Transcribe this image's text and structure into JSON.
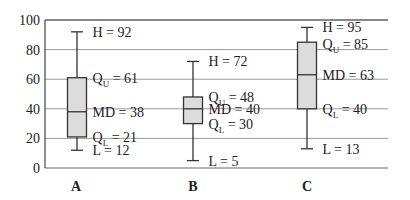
{
  "chart_data": {
    "type": "boxplot",
    "title": "",
    "xlabel": "",
    "ylabel": "",
    "ylim": [
      0,
      100
    ],
    "yticks": [
      0,
      20,
      40,
      60,
      80,
      100
    ],
    "grid": true,
    "categories": [
      "A",
      "B",
      "C"
    ],
    "series": [
      {
        "name": "A",
        "H": 92,
        "QU": 61,
        "MD": 38,
        "QL": 21,
        "L": 12,
        "labels": {
          "H": "H = 92",
          "QU": "= 61",
          "MD": "MD = 38",
          "QL": "= 21",
          "L": "L = 12"
        }
      },
      {
        "name": "B",
        "H": 72,
        "QU": 48,
        "MD": 40,
        "QL": 30,
        "L": 5,
        "labels": {
          "H": "H = 72",
          "QU": "= 48",
          "MD": "MD = 40",
          "QL": "= 30",
          "L": "L = 5"
        }
      },
      {
        "name": "C",
        "H": 95,
        "QU": 85,
        "MD": 63,
        "QL": 40,
        "L": 13,
        "labels": {
          "H": "H = 95",
          "QU": "= 85",
          "MD": "MD = 63",
          "QL": "= 40",
          "L": "L = 13"
        }
      }
    ],
    "colors": {
      "box_fill": "#dcdcdc",
      "line": "#333333",
      "grid": "#9a9a9a",
      "axis": "#444444"
    }
  }
}
